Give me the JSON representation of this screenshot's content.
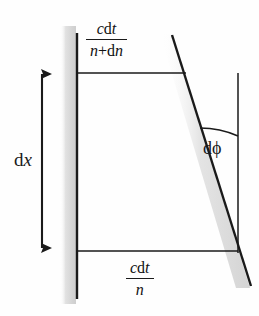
{
  "figure": {
    "background_color": "#fefefe",
    "ink_color": "#1a1a1a",
    "smudge_color": "#e3e3e3",
    "width": 259,
    "height": 316
  },
  "labels": {
    "dx": {
      "d": "d",
      "x": "x",
      "full": "dx"
    },
    "dphi": {
      "full": "dϕ",
      "d": "d",
      "phi": "ϕ"
    }
  },
  "fractions": {
    "top": {
      "numerator_parts": {
        "c": "c",
        "d": "d",
        "t": "t"
      },
      "numerator": "cdt",
      "denominator_parts": {
        "n": "n",
        "plus": "+",
        "d": "d",
        "dn": "n"
      },
      "denominator": "n+dn",
      "full": "cdt/(n+dn)"
    },
    "bottom": {
      "numerator_parts": {
        "c": "c",
        "d": "d",
        "t": "t"
      },
      "numerator": "cdt",
      "denominator_parts": {
        "n": "n"
      },
      "denominator": "n",
      "full": "cdt/n"
    }
  },
  "geometry": {
    "left_vertical_line": {
      "x": 77,
      "y1": 33,
      "y2": 299
    },
    "right_vertical_line": {
      "x": 238,
      "y1": 73,
      "y2": 253
    },
    "slanted_ray": {
      "x1": 172,
      "y1": 35,
      "x2": 251,
      "y2": 286
    },
    "top_wavefront": {
      "x1": 77,
      "y1": 73,
      "x2": 186,
      "y2": 73
    },
    "bottom_wavefront": {
      "x1": 77,
      "y1": 251,
      "x2": 238,
      "y2": 251
    },
    "dx_arrow": {
      "x": 42,
      "y_top": 66,
      "y_bottom": 256,
      "heads": "both"
    },
    "angle_arc": {
      "from_x": 200,
      "from_y": 128,
      "to_x": 238,
      "to_y": 136
    }
  }
}
